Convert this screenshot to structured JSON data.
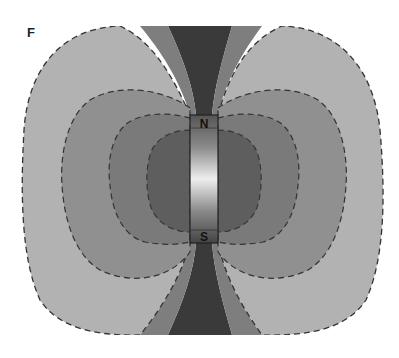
{
  "figure": {
    "panel_label": "F",
    "magnet": {
      "north_label": "N",
      "south_label": "S"
    },
    "zones": [
      {
        "name": "outer",
        "color": "#b2b2b2"
      },
      {
        "name": "middle",
        "color": "#8f8f8f"
      },
      {
        "name": "inner",
        "color": "#7a7a7a"
      },
      {
        "name": "core",
        "color": "#5e5e5e"
      },
      {
        "name": "polar-channel",
        "color": "#3a3a3a"
      },
      {
        "name": "polar-flank",
        "color": "#808080"
      }
    ],
    "contour_style": "dashed"
  }
}
